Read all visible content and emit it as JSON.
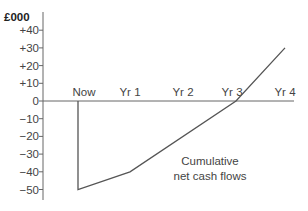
{
  "chart_data": {
    "type": "line",
    "title": "",
    "ylabel": "£000",
    "xlabel": "",
    "categories": [
      "Now",
      "Yr 1",
      "Yr 2",
      "Yr 3",
      "Yr 4"
    ],
    "series": [
      {
        "name": "Cumulative net cash flows",
        "values": [
          -50,
          -40,
          -20,
          0,
          30
        ]
      }
    ],
    "y_ticks": [
      "+40",
      "+30",
      "+20",
      "+10",
      "0",
      "−10",
      "−20",
      "−30",
      "−40",
      "−50"
    ],
    "y_tick_values": [
      40,
      30,
      20,
      10,
      0,
      -10,
      -20,
      -30,
      -40,
      -50
    ],
    "ylim": [
      -55,
      50
    ],
    "grid": false,
    "legend": "none",
    "annotations": [
      {
        "text_line1": "Cumulative",
        "text_line2": "net cash flows"
      }
    ]
  },
  "labels": {
    "unit": "£000",
    "anno_line1": "Cumulative",
    "anno_line2": "net cash flows"
  },
  "colors": {
    "axis": "#666666",
    "line": "#555555"
  }
}
